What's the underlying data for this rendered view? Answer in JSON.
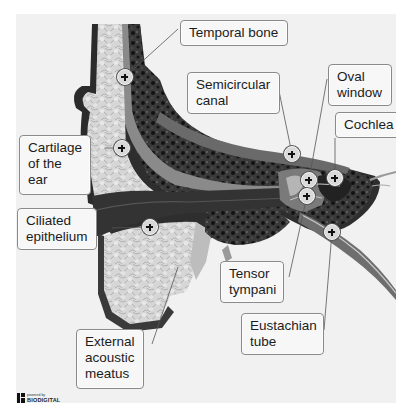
{
  "diagram": {
    "labels": [
      {
        "id": "temporal-bone",
        "text": "Temporal bone"
      },
      {
        "id": "semicircular-canal",
        "text": "Semicircular\ncanal"
      },
      {
        "id": "oval-window",
        "text": "Oval\nwindow"
      },
      {
        "id": "cochlea",
        "text": "Cochlea"
      },
      {
        "id": "cartilage-of-the-ear",
        "text": "Cartilage\nof the\near"
      },
      {
        "id": "ciliated-epithelium",
        "text": "Ciliated\nepithelium"
      },
      {
        "id": "tensor-tympani",
        "text": "Tensor\ntympani"
      },
      {
        "id": "eustachian-tube",
        "text": "Eustachian\ntube"
      },
      {
        "id": "external-acoustic-meatus",
        "text": "External\nacoustic\nmeatus"
      }
    ],
    "marker_symbol": "+"
  },
  "branding": {
    "small": "powered by",
    "name": "BIODIGITAL"
  }
}
